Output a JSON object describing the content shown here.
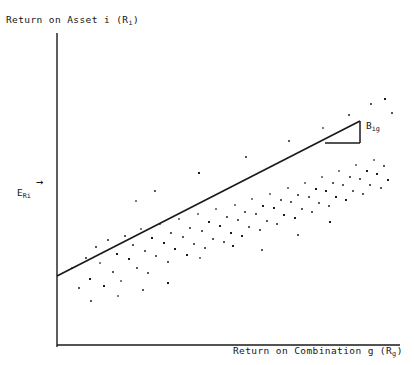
{
  "figure": {
    "background_color": "#ffffff",
    "ink_color": "#1a1a1a"
  },
  "labels": {
    "y_axis_title": "Return on Asset i (R i)",
    "y_axis_title_main": "Return on Asset i (R",
    "y_axis_title_sub": "i",
    "y_axis_title_tail": ")",
    "x_axis_title_main": "Return on Combination g (R",
    "x_axis_title_sub": "g",
    "x_axis_title_tail": ")",
    "expected_return_main": "E",
    "expected_return_sub": "Ri",
    "expected_return_arrow": "→",
    "beta_main": "B",
    "beta_sub": "ig"
  },
  "chart_data": {
    "type": "scatter",
    "title": "",
    "subtitle": "",
    "xlabel": "Return on Combination g (Rg)",
    "ylabel": "Return on Asset i (Ri)",
    "grid": false,
    "legend": "none",
    "axis_ticks": "none",
    "xlim": [
      0,
      100
    ],
    "ylim": [
      0,
      100
    ],
    "annotations": [
      {
        "name": "expected-return-marker",
        "text": "E_Ri",
        "arrow": "right",
        "x_px": 20,
        "y_px": 192,
        "description": "Expected return on asset i marked on the vertical axis with a rightward arrow"
      },
      {
        "name": "beta-slope-label",
        "text": "B_ig",
        "x_px": 367,
        "y_px": 127,
        "description": "Beta of asset i with respect to combination g, labelling the slope triangle"
      }
    ],
    "axes_px": {
      "y_axis": {
        "x": 57,
        "y_top": 33,
        "y_bottom": 347
      },
      "x_axis": {
        "y": 345,
        "x_left": 57,
        "x_right": 400
      }
    },
    "regression_line": {
      "name": "characteristic-line",
      "x0_px": 57,
      "y0_px": 276,
      "x1_px": 360,
      "y1_px": 121,
      "slope_px": -0.5116,
      "description": "Fitted characteristic line through the scatter"
    },
    "slope_triangle": {
      "name": "slope-triangle",
      "apex_px": {
        "x": 360,
        "y": 121
      },
      "corner_px": {
        "x": 360,
        "y": 143
      },
      "base_px": {
        "x": 325,
        "y": 143
      },
      "rise_px": 22,
      "run_px": 35
    },
    "points_px": [
      [
        72,
        268
      ],
      [
        79,
        288
      ],
      [
        86,
        258
      ],
      [
        90,
        279
      ],
      [
        96,
        247
      ],
      [
        100,
        263
      ],
      [
        104,
        286
      ],
      [
        108,
        240
      ],
      [
        113,
        272
      ],
      [
        117,
        254
      ],
      [
        121,
        281
      ],
      [
        125,
        236
      ],
      [
        129,
        259
      ],
      [
        133,
        245
      ],
      [
        137,
        268
      ],
      [
        141,
        229
      ],
      [
        145,
        251
      ],
      [
        148,
        273
      ],
      [
        152,
        238
      ],
      [
        156,
        256
      ],
      [
        160,
        224
      ],
      [
        164,
        243
      ],
      [
        168,
        262
      ],
      [
        171,
        233
      ],
      [
        175,
        249
      ],
      [
        179,
        219
      ],
      [
        183,
        237
      ],
      [
        187,
        255
      ],
      [
        190,
        228
      ],
      [
        194,
        244
      ],
      [
        198,
        214
      ],
      [
        202,
        231
      ],
      [
        205,
        248
      ],
      [
        209,
        222
      ],
      [
        213,
        239
      ],
      [
        216,
        209
      ],
      [
        220,
        226
      ],
      [
        224,
        242
      ],
      [
        227,
        217
      ],
      [
        231,
        233
      ],
      [
        235,
        205
      ],
      [
        238,
        220
      ],
      [
        242,
        236
      ],
      [
        245,
        212
      ],
      [
        249,
        227
      ],
      [
        252,
        199
      ],
      [
        256,
        214
      ],
      [
        260,
        230
      ],
      [
        263,
        206
      ],
      [
        267,
        221
      ],
      [
        270,
        194
      ],
      [
        274,
        208
      ],
      [
        277,
        224
      ],
      [
        281,
        200
      ],
      [
        284,
        215
      ],
      [
        288,
        188
      ],
      [
        291,
        202
      ],
      [
        295,
        218
      ],
      [
        298,
        195
      ],
      [
        302,
        209
      ],
      [
        305,
        183
      ],
      [
        309,
        197
      ],
      [
        312,
        212
      ],
      [
        316,
        189
      ],
      [
        319,
        203
      ],
      [
        322,
        177
      ],
      [
        326,
        191
      ],
      [
        329,
        206
      ],
      [
        333,
        183
      ],
      [
        336,
        197
      ],
      [
        339,
        171
      ],
      [
        343,
        185
      ],
      [
        346,
        200
      ],
      [
        350,
        177
      ],
      [
        353,
        191
      ],
      [
        356,
        165
      ],
      [
        360,
        179
      ],
      [
        363,
        194
      ],
      [
        367,
        171
      ],
      [
        370,
        185
      ],
      [
        374,
        160
      ],
      [
        377,
        174
      ],
      [
        381,
        188
      ],
      [
        384,
        166
      ],
      [
        388,
        180
      ],
      [
        136,
        201
      ],
      [
        155,
        191
      ],
      [
        199,
        173
      ],
      [
        246,
        157
      ],
      [
        289,
        141
      ],
      [
        323,
        128
      ],
      [
        349,
        115
      ],
      [
        371,
        104
      ],
      [
        385,
        99
      ],
      [
        392,
        113
      ],
      [
        200,
        258
      ],
      [
        233,
        246
      ],
      [
        262,
        250
      ],
      [
        298,
        235
      ],
      [
        330,
        222
      ],
      [
        118,
        296
      ],
      [
        143,
        290
      ],
      [
        168,
        283
      ],
      [
        91,
        301
      ]
    ]
  }
}
